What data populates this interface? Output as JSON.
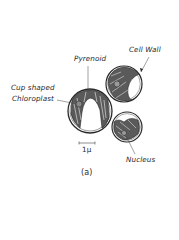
{
  "figure": {
    "caption": "(a)",
    "scale_bar": "1μ",
    "labels": {
      "pyrenoid": "Pyrenoid",
      "cell_wall": "Cell Wall",
      "chloroplast_line1": "Cup shaped",
      "chloroplast_line2": "Chloroplast",
      "nucleus": "Nucleus"
    },
    "colors": {
      "ink": "#2a2a2a",
      "background": "#ffffff"
    }
  }
}
